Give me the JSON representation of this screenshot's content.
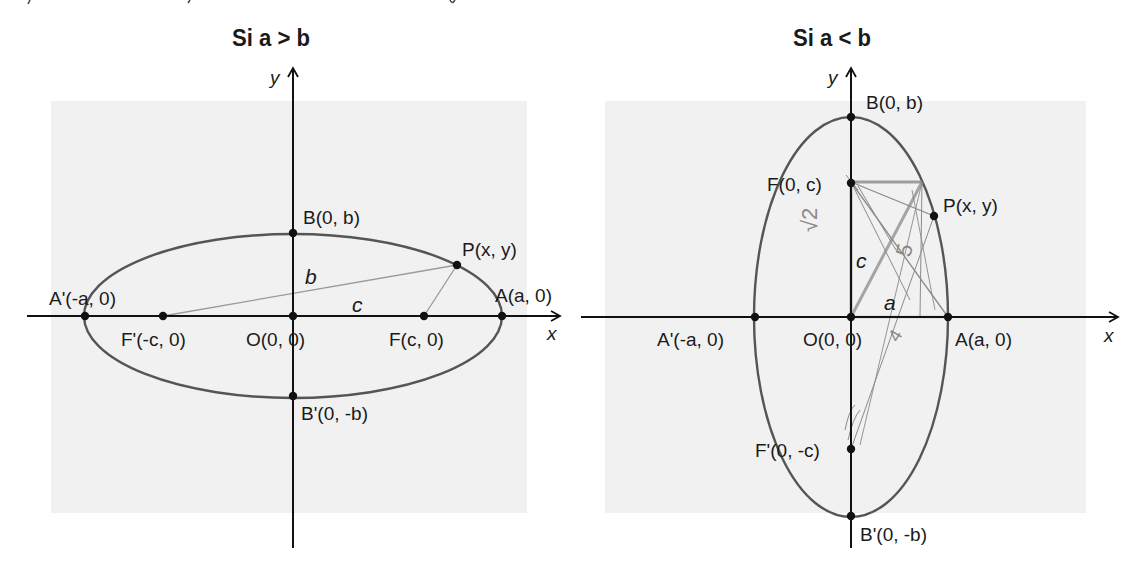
{
  "panels": [
    {
      "title": "Si a > b",
      "axis_labels": {
        "x": "x",
        "y": "y"
      },
      "points": {
        "A_prime": "A'(-a, 0)",
        "F_prime": "F'(-c, 0)",
        "O": "O(0, 0)",
        "F": "F(c, 0)",
        "A": "A(a, 0)",
        "B": "B(0, b)",
        "B_prime": "B'(0, -b)",
        "P": "P(x, y)"
      },
      "segment_labels": {
        "b": "b",
        "c": "c"
      }
    },
    {
      "title": "Si a < b",
      "axis_labels": {
        "x": "x",
        "y": "y"
      },
      "points": {
        "A_prime": "A'(-a, 0)",
        "O": "O(0, 0)",
        "A": "A(a, 0)",
        "B": "B(0, b)",
        "B_prime": "B'(0, -b)",
        "F": "F(0, c)",
        "F_prime": "F'(0, -c)",
        "P": "P(x, y)"
      },
      "segment_labels": {
        "c": "c",
        "a": "a"
      },
      "handwritten_marks": {
        "sqrt2": "√2",
        "five": "5",
        "four": "4"
      }
    }
  ],
  "colors": {
    "panel_background": "#f1f1f1",
    "axis": "#111111",
    "ellipse": "#555555",
    "construction_line": "#9a9a9a",
    "pencil": "#8a8a8a"
  }
}
